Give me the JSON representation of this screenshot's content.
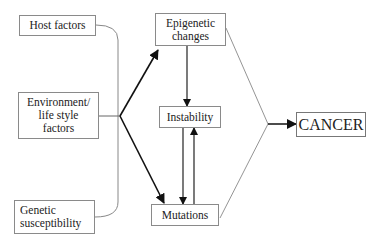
{
  "diagram": {
    "nodes": {
      "host_factors": "Host factors",
      "environment": "Environment/\nlife style\nfactors",
      "genetic": "Genetic\nsusceptibility",
      "epigenetic": "Epigenetic\nchanges",
      "instability": "Instability",
      "mutations": "Mutations",
      "cancer": "CANCER"
    },
    "edges": [
      {
        "from": "host_factors, environment, genetic",
        "to": "epigenetic"
      },
      {
        "from": "host_factors, environment, genetic",
        "to": "mutations"
      },
      {
        "from": "epigenetic",
        "to": "instability"
      },
      {
        "from": "instability",
        "to": "mutations"
      },
      {
        "from": "mutations",
        "to": "instability"
      },
      {
        "from": "epigenetic, mutations",
        "to": "cancer"
      }
    ],
    "colors": {
      "line": "#222222",
      "thin_line": "#888888",
      "box_border": "#8a8a8a"
    }
  }
}
